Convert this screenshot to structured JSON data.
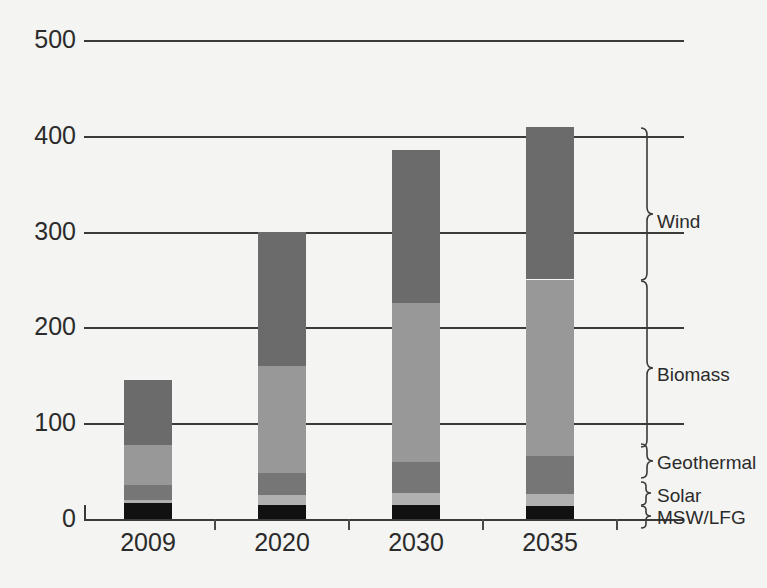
{
  "chart_data": {
    "type": "bar",
    "subtype": "stacked-bar",
    "title": "",
    "xlabel": "",
    "ylabel": "",
    "categories": [
      "2009",
      "2020",
      "2030",
      "2035"
    ],
    "ylim": [
      0,
      500
    ],
    "yticks": [
      0,
      100,
      200,
      300,
      400,
      500
    ],
    "ytick_labels": [
      "0",
      "100",
      "200",
      "300",
      "400",
      "500"
    ],
    "grid": true,
    "grid_axis": "y",
    "legend_position": "right-brackets",
    "stack_order_bottom_to_top": [
      "MSW/LFG",
      "Solar",
      "Geothermal",
      "Biomass",
      "Wind"
    ],
    "series": [
      {
        "name": "MSW/LFG",
        "color": "#111111",
        "values": [
          17,
          15,
          15,
          14
        ]
      },
      {
        "name": "Solar",
        "color": "#b0b0b0",
        "values": [
          3,
          10,
          12,
          12
        ]
      },
      {
        "name": "Geothermal",
        "color": "#767676",
        "values": [
          15,
          23,
          33,
          40
        ]
      },
      {
        "name": "Biomass",
        "color": "#989898",
        "values": [
          42,
          112,
          165,
          184
        ]
      },
      {
        "name": "Wind",
        "color": "#6b6b6b",
        "values": [
          68,
          140,
          160,
          159
        ]
      }
    ],
    "totals": [
      145,
      300,
      385,
      409
    ]
  },
  "legend": {
    "entries": [
      {
        "label": "Wind"
      },
      {
        "label": "Biomass"
      },
      {
        "label": "Geothermal"
      },
      {
        "label": "Solar"
      },
      {
        "label": "MSW/LFG"
      }
    ]
  },
  "colors": {
    "background": "#f4f4f2",
    "axis": "#3a3a3a",
    "text": "#2b2b2b"
  }
}
